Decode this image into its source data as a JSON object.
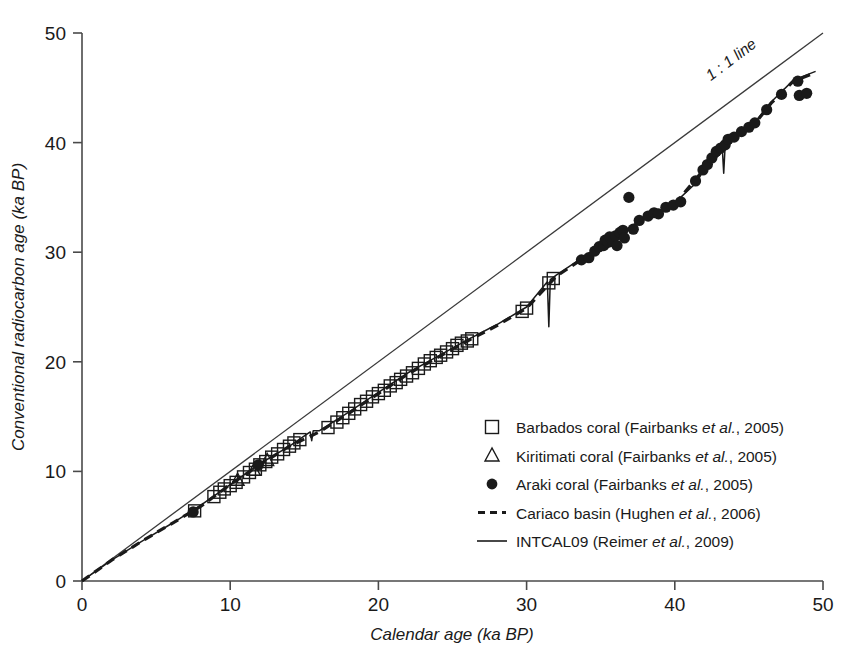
{
  "figure": {
    "background": "#ffffff",
    "ink": "#1a1a1a"
  },
  "chart_data": {
    "type": "scatter",
    "title": "",
    "xlabel": "Calendar age (ka BP)",
    "ylabel": "Conventional radiocarbon age (ka BP)",
    "xlim": [
      0,
      50
    ],
    "ylim": [
      0,
      50
    ],
    "xticks": [
      0,
      10,
      20,
      30,
      40,
      50
    ],
    "yticks": [
      0,
      10,
      20,
      30,
      40,
      50
    ],
    "xtick_labels": [
      "0",
      "10",
      "20",
      "30",
      "40",
      "50"
    ],
    "ytick_labels": [
      "0",
      "10",
      "20",
      "30",
      "40",
      "50"
    ],
    "grid": false,
    "legend_position": "center-right",
    "annotations": [
      {
        "text": "1 : 1 line",
        "x": 44.0,
        "y": 47.2,
        "rotation": -37
      }
    ],
    "series": [
      {
        "name": "Barbados coral (Fairbanks et al., 2005)",
        "marker": "open-square",
        "type": "scatter",
        "points": [
          [
            7.6,
            6.4
          ],
          [
            8.9,
            7.7
          ],
          [
            9.3,
            8.1
          ],
          [
            9.6,
            8.4
          ],
          [
            10.0,
            8.7
          ],
          [
            10.4,
            9.0
          ],
          [
            10.9,
            9.5
          ],
          [
            11.3,
            9.9
          ],
          [
            11.7,
            10.2
          ],
          [
            12.0,
            10.6
          ],
          [
            12.4,
            10.9
          ],
          [
            12.8,
            11.3
          ],
          [
            13.2,
            11.6
          ],
          [
            13.6,
            12.0
          ],
          [
            14.0,
            12.3
          ],
          [
            14.3,
            12.6
          ],
          [
            14.7,
            12.9
          ],
          [
            16.6,
            14.0
          ],
          [
            17.2,
            14.5
          ],
          [
            17.6,
            14.9
          ],
          [
            18.0,
            15.3
          ],
          [
            18.4,
            15.7
          ],
          [
            18.8,
            16.1
          ],
          [
            19.2,
            16.4
          ],
          [
            19.6,
            16.8
          ],
          [
            20.0,
            17.1
          ],
          [
            20.4,
            17.4
          ],
          [
            20.8,
            17.8
          ],
          [
            21.2,
            18.1
          ],
          [
            21.5,
            18.4
          ],
          [
            21.9,
            18.7
          ],
          [
            22.3,
            19.0
          ],
          [
            22.7,
            19.4
          ],
          [
            23.1,
            19.8
          ],
          [
            23.5,
            20.1
          ],
          [
            23.9,
            20.4
          ],
          [
            24.2,
            20.6
          ],
          [
            24.6,
            20.9
          ],
          [
            25.0,
            21.2
          ],
          [
            25.3,
            21.5
          ],
          [
            25.6,
            21.7
          ],
          [
            26.0,
            21.9
          ],
          [
            26.3,
            22.1
          ],
          [
            29.7,
            24.6
          ],
          [
            30.0,
            24.9
          ],
          [
            31.5,
            27.2
          ],
          [
            31.8,
            27.6
          ]
        ]
      },
      {
        "name": "Kiritimati coral (Fairbanks et al., 2005)",
        "marker": "open-triangle",
        "type": "scatter",
        "points": [
          [
            10.5,
            9.2
          ],
          [
            11.6,
            10.1
          ],
          [
            12.5,
            11.0
          ]
        ]
      },
      {
        "name": "Araki coral (Fairbanks et al., 2005)",
        "marker": "filled-circle",
        "type": "scatter",
        "points": [
          [
            7.5,
            6.3
          ],
          [
            11.9,
            10.6
          ],
          [
            33.7,
            29.3
          ],
          [
            34.2,
            29.5
          ],
          [
            34.6,
            30.1
          ],
          [
            34.9,
            30.5
          ],
          [
            35.2,
            30.6
          ],
          [
            35.3,
            31.1
          ],
          [
            35.5,
            30.9
          ],
          [
            35.6,
            31.4
          ],
          [
            35.8,
            31.0
          ],
          [
            36.0,
            31.5
          ],
          [
            36.1,
            30.6
          ],
          [
            36.3,
            31.8
          ],
          [
            36.5,
            32.0
          ],
          [
            36.6,
            31.3
          ],
          [
            36.9,
            35.0
          ],
          [
            37.2,
            32.1
          ],
          [
            37.6,
            32.9
          ],
          [
            38.2,
            33.3
          ],
          [
            38.6,
            33.6
          ],
          [
            38.9,
            33.5
          ],
          [
            39.4,
            34.1
          ],
          [
            39.9,
            34.3
          ],
          [
            40.4,
            34.6
          ],
          [
            41.4,
            36.5
          ],
          [
            41.9,
            37.5
          ],
          [
            42.2,
            38.0
          ],
          [
            42.5,
            38.6
          ],
          [
            42.8,
            39.2
          ],
          [
            43.1,
            39.5
          ],
          [
            43.4,
            39.8
          ],
          [
            43.6,
            40.3
          ],
          [
            44.0,
            40.5
          ],
          [
            44.5,
            41.0
          ],
          [
            45.0,
            41.4
          ],
          [
            45.4,
            41.8
          ],
          [
            46.2,
            43.0
          ],
          [
            47.2,
            44.4
          ],
          [
            48.3,
            45.6
          ],
          [
            48.4,
            44.3
          ],
          [
            48.9,
            44.5
          ]
        ]
      },
      {
        "name": "Cariaco basin (Hughen et al., 2006)",
        "marker": "dashed-line",
        "type": "line",
        "points": [
          [
            0.0,
            0.0
          ],
          [
            2.0,
            1.9
          ],
          [
            4.0,
            3.6
          ],
          [
            6.0,
            5.2
          ],
          [
            8.0,
            6.8
          ],
          [
            10.0,
            8.8
          ],
          [
            12.0,
            10.6
          ],
          [
            14.0,
            12.3
          ],
          [
            16.0,
            13.6
          ],
          [
            18.0,
            15.3
          ],
          [
            20.0,
            17.1
          ],
          [
            22.0,
            18.9
          ],
          [
            24.0,
            20.4
          ],
          [
            26.0,
            21.9
          ],
          [
            28.0,
            23.3
          ],
          [
            30.0,
            24.9
          ],
          [
            32.0,
            27.8
          ],
          [
            34.0,
            29.6
          ],
          [
            36.0,
            31.3
          ],
          [
            38.0,
            33.1
          ],
          [
            40.0,
            34.4
          ],
          [
            42.0,
            37.6
          ],
          [
            44.0,
            40.4
          ],
          [
            45.5,
            41.9
          ],
          [
            46.5,
            43.6
          ],
          [
            48.0,
            45.6
          ],
          [
            49.5,
            46.4
          ]
        ]
      },
      {
        "name": "INTCAL09 (Reimer et al., 2009)",
        "marker": "solid-line",
        "type": "line",
        "points": [
          [
            0.0,
            0.0
          ],
          [
            2.0,
            1.9
          ],
          [
            4.0,
            3.6
          ],
          [
            6.0,
            5.2
          ],
          [
            8.0,
            6.9
          ],
          [
            10.0,
            8.8
          ],
          [
            12.0,
            10.7
          ],
          [
            14.0,
            12.3
          ],
          [
            15.4,
            13.6
          ],
          [
            15.5,
            12.8
          ],
          [
            15.6,
            13.7
          ],
          [
            16.0,
            13.7
          ],
          [
            18.0,
            15.4
          ],
          [
            20.0,
            17.2
          ],
          [
            22.0,
            19.0
          ],
          [
            24.0,
            20.5
          ],
          [
            26.0,
            22.0
          ],
          [
            28.0,
            23.4
          ],
          [
            30.0,
            25.0
          ],
          [
            31.4,
            27.3
          ],
          [
            31.5,
            23.2
          ],
          [
            31.6,
            27.5
          ],
          [
            32.0,
            27.9
          ],
          [
            34.0,
            29.7
          ],
          [
            36.0,
            31.4
          ],
          [
            38.0,
            33.2
          ],
          [
            40.0,
            34.5
          ],
          [
            41.5,
            36.4
          ],
          [
            42.0,
            37.7
          ],
          [
            43.2,
            39.6
          ],
          [
            43.3,
            37.2
          ],
          [
            43.4,
            39.8
          ],
          [
            44.0,
            40.6
          ],
          [
            45.5,
            42.0
          ],
          [
            46.5,
            43.7
          ],
          [
            48.0,
            45.7
          ],
          [
            49.5,
            46.5
          ]
        ]
      }
    ],
    "reference_line": {
      "name": "1 : 1 line",
      "from": [
        0,
        0
      ],
      "to": [
        50,
        50
      ]
    }
  },
  "legend": {
    "entries": [
      {
        "marker": "open-square",
        "label": "Barbados coral (Fairbanks ",
        "italic": "et al.",
        "tail": ", 2005)"
      },
      {
        "marker": "open-triangle",
        "label": "Kiritimati coral (Fairbanks ",
        "italic": "et al.",
        "tail": ", 2005)"
      },
      {
        "marker": "filled-circle",
        "label": "Araki coral (Fairbanks ",
        "italic": "et al.",
        "tail": ", 2005)"
      },
      {
        "marker": "dashed-line",
        "label": "Cariaco basin (Hughen ",
        "italic": "et al.",
        "tail": ", 2006)"
      },
      {
        "marker": "solid-line",
        "label": "INTCAL09 (Reimer ",
        "italic": "et al.",
        "tail": ", 2009)"
      }
    ]
  }
}
